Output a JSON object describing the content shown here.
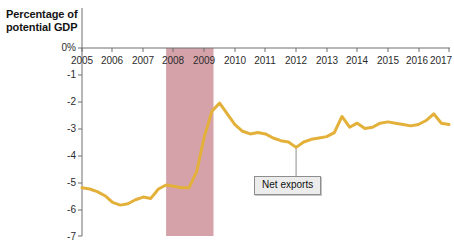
{
  "chart_data": {
    "type": "line",
    "title": "Percentage of potential GDP",
    "xlabel": "",
    "ylabel": "Percentage of potential GDP",
    "y_unit_label": "0%",
    "xlim": [
      2005,
      2017
    ],
    "ylim": [
      -7,
      0
    ],
    "grid": false,
    "legend_position": "inline-annotation",
    "x_ticks": [
      "2005",
      "2006",
      "2007",
      "2008",
      "2009",
      "2010",
      "2011",
      "2012",
      "2013",
      "2014",
      "2015",
      "2016",
      "2017"
    ],
    "y_ticks": [
      "0%",
      "-1",
      "-2",
      "-3",
      "-4",
      "-5",
      "-6",
      "-7"
    ],
    "series": [
      {
        "name": "Net exports",
        "color": "#E3B03A",
        "x": [
          2005.0,
          2005.25,
          2005.5,
          2005.75,
          2006.0,
          2006.25,
          2006.5,
          2006.75,
          2007.0,
          2007.25,
          2007.5,
          2007.75,
          2008.0,
          2008.25,
          2008.5,
          2008.75,
          2009.0,
          2009.25,
          2009.5,
          2009.75,
          2010.0,
          2010.25,
          2010.5,
          2010.75,
          2011.0,
          2011.25,
          2011.5,
          2011.75,
          2012.0,
          2012.25,
          2012.5,
          2012.75,
          2013.0,
          2013.25,
          2013.5,
          2013.75,
          2014.0,
          2014.25,
          2014.5,
          2014.75,
          2015.0,
          2015.25,
          2015.5,
          2015.75,
          2016.0,
          2016.25,
          2016.5,
          2016.75,
          2017.0
        ],
        "values": [
          -5.2,
          -5.25,
          -5.35,
          -5.5,
          -5.75,
          -5.85,
          -5.8,
          -5.65,
          -5.55,
          -5.6,
          -5.25,
          -5.1,
          -5.15,
          -5.2,
          -5.2,
          -4.6,
          -3.3,
          -2.35,
          -2.05,
          -2.45,
          -2.85,
          -3.1,
          -3.2,
          -3.15,
          -3.2,
          -3.35,
          -3.45,
          -3.5,
          -3.7,
          -3.5,
          -3.4,
          -3.35,
          -3.3,
          -3.15,
          -2.55,
          -2.95,
          -2.8,
          -3.0,
          -2.95,
          -2.8,
          -2.75,
          -2.8,
          -2.85,
          -2.9,
          -2.85,
          -2.7,
          -2.45,
          -2.8,
          -2.85
        ]
      }
    ],
    "shaded_regions": [
      {
        "name": "recession-band",
        "label": "",
        "x_start": 2007.75,
        "x_end": 2009.3,
        "color": "#D5A2AA"
      }
    ],
    "annotations": [
      {
        "name": "net-exports",
        "text": "Net exports",
        "points_to_x": 2012.0,
        "points_to_y": -3.7
      }
    ]
  }
}
